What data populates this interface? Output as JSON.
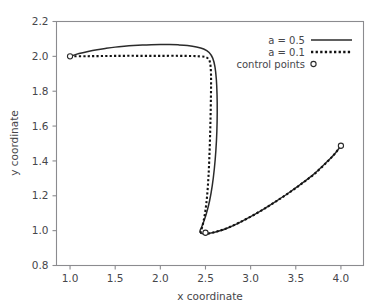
{
  "chart_data": {
    "type": "line",
    "title": "",
    "xlabel": "x coordinate",
    "ylabel": "y coordinate",
    "xlim": [
      0.85,
      4.25
    ],
    "ylim": [
      0.8,
      2.2
    ],
    "xticks": [
      "1.0",
      "1.5",
      "2.0",
      "2.5",
      "3.0",
      "3.5",
      "4.0"
    ],
    "xtick_values": [
      1.0,
      1.5,
      2.0,
      2.5,
      3.0,
      3.5,
      4.0
    ],
    "yticks": [
      "0.8",
      "1.0",
      "1.2",
      "1.4",
      "1.6",
      "1.8",
      "2.0",
      "2.2"
    ],
    "ytick_values": [
      0.8,
      1.0,
      1.2,
      1.4,
      1.6,
      1.8,
      2.0,
      2.2
    ],
    "grid": false,
    "legend_position": "top-right",
    "legend": [
      {
        "label": "a = 0.5",
        "style": "solid-line"
      },
      {
        "label": "a = 0.1",
        "style": "dotted-line"
      },
      {
        "label": "control points",
        "style": "open-circle-marker"
      }
    ],
    "series": [
      {
        "name": "a = 0.5",
        "style": "solid",
        "points": [
          [
            1.0,
            2.0
          ],
          [
            1.1,
            2.016
          ],
          [
            1.2,
            2.028
          ],
          [
            1.3,
            2.038
          ],
          [
            1.4,
            2.046
          ],
          [
            1.5,
            2.053
          ],
          [
            1.6,
            2.058
          ],
          [
            1.7,
            2.062
          ],
          [
            1.8,
            2.065
          ],
          [
            1.9,
            2.067
          ],
          [
            2.0,
            2.068
          ],
          [
            2.1,
            2.068
          ],
          [
            2.2,
            2.066
          ],
          [
            2.3,
            2.062
          ],
          [
            2.4,
            2.054
          ],
          [
            2.48,
            2.042
          ],
          [
            2.54,
            2.022
          ],
          [
            2.58,
            1.99
          ],
          [
            2.605,
            1.94
          ],
          [
            2.62,
            1.87
          ],
          [
            2.628,
            1.78
          ],
          [
            2.63,
            1.68
          ],
          [
            2.626,
            1.57
          ],
          [
            2.615,
            1.46
          ],
          [
            2.598,
            1.355
          ],
          [
            2.575,
            1.258
          ],
          [
            2.545,
            1.17
          ],
          [
            2.51,
            1.098
          ],
          [
            2.478,
            1.048
          ],
          [
            2.455,
            1.018
          ],
          [
            2.44,
            1.0
          ],
          [
            2.44,
            0.99
          ],
          [
            2.46,
            0.984
          ],
          [
            2.5,
            0.982
          ],
          [
            2.56,
            0.986
          ],
          [
            2.64,
            0.996
          ],
          [
            2.74,
            1.014
          ],
          [
            2.86,
            1.042
          ],
          [
            3.0,
            1.08
          ],
          [
            3.14,
            1.122
          ],
          [
            3.28,
            1.168
          ],
          [
            3.42,
            1.216
          ],
          [
            3.56,
            1.268
          ],
          [
            3.7,
            1.324
          ],
          [
            3.84,
            1.392
          ],
          [
            3.93,
            1.44
          ],
          [
            4.0,
            1.487
          ]
        ]
      },
      {
        "name": "a = 0.1",
        "style": "dotted",
        "points": [
          [
            1.0,
            2.0
          ],
          [
            1.2,
            2.001
          ],
          [
            1.4,
            2.002
          ],
          [
            1.6,
            2.003
          ],
          [
            1.8,
            2.003
          ],
          [
            2.0,
            2.003
          ],
          [
            2.2,
            2.003
          ],
          [
            2.35,
            2.002
          ],
          [
            2.44,
            2.0
          ],
          [
            2.5,
            1.996
          ],
          [
            2.535,
            1.984
          ],
          [
            2.552,
            1.96
          ],
          [
            2.56,
            1.915
          ],
          [
            2.562,
            1.85
          ],
          [
            2.56,
            1.76
          ],
          [
            2.556,
            1.65
          ],
          [
            2.55,
            1.53
          ],
          [
            2.542,
            1.41
          ],
          [
            2.532,
            1.3
          ],
          [
            2.518,
            1.2
          ],
          [
            2.5,
            1.118
          ],
          [
            2.48,
            1.058
          ],
          [
            2.462,
            1.018
          ],
          [
            2.45,
            0.996
          ],
          [
            2.45,
            0.988
          ],
          [
            2.47,
            0.983
          ],
          [
            2.51,
            0.982
          ],
          [
            2.57,
            0.987
          ],
          [
            2.65,
            0.998
          ],
          [
            2.75,
            1.017
          ],
          [
            2.87,
            1.045
          ],
          [
            3.01,
            1.083
          ],
          [
            3.15,
            1.125
          ],
          [
            3.29,
            1.171
          ],
          [
            3.43,
            1.219
          ],
          [
            3.57,
            1.271
          ],
          [
            3.71,
            1.327
          ],
          [
            3.85,
            1.396
          ],
          [
            3.935,
            1.443
          ],
          [
            4.0,
            1.487
          ]
        ]
      }
    ],
    "control_points": {
      "name": "control points",
      "marker": "open-circle",
      "points": [
        [
          1.0,
          2.0
        ],
        [
          2.5,
          0.988
        ],
        [
          4.0,
          1.487
        ]
      ]
    }
  },
  "colors": {
    "background": "#ffffff",
    "axis": "#8b8b8f",
    "text": "#46464a",
    "curve_solid": "#2b2b2b",
    "curve_dotted": "#121212",
    "marker_fill": "#ffffff"
  }
}
